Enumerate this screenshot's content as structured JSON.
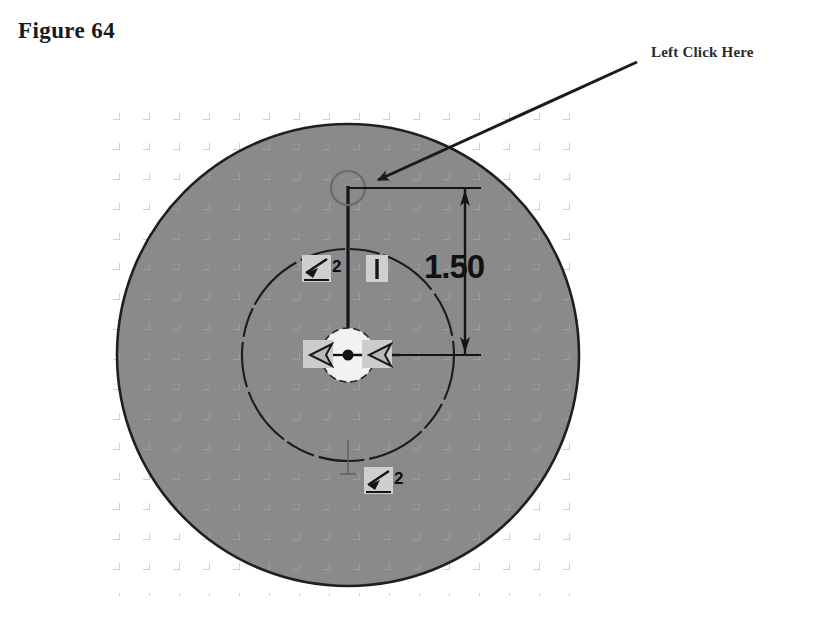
{
  "figure": {
    "label": "Figure 64"
  },
  "callout": {
    "label": "Left Click Here",
    "arrow_from": [
      637,
      62
    ],
    "arrow_to": [
      372,
      183
    ]
  },
  "sketch": {
    "title": "circle sketch with vertical dimension",
    "background_color": "#ffffff",
    "face_fill_color": "#8a8a8a",
    "edge_color": "#1f1f1f",
    "grid_color": "#c9c9c9",
    "grid_spacing_px": 30,
    "outer_circle": {
      "cx": 348,
      "cy": 355,
      "r": 231
    },
    "inner_circle": {
      "cx": 348,
      "cy": 355,
      "r": 106
    },
    "center_point": {
      "cx": 348,
      "cy": 355
    },
    "top_point": {
      "cx": 348,
      "cy": 188,
      "highlight_r": 17
    },
    "construction_line": {
      "x": 348,
      "y1": 188,
      "y2": 355
    }
  },
  "dimension": {
    "value_text": "1.50",
    "text_x": 424,
    "text_y": 248,
    "ext_line_top_y": 188,
    "ext_line_bottom_y": 355,
    "ext_line_x1": 348,
    "ext_line_x2": 481,
    "dim_line_x": 465,
    "arrow_top_y": 198,
    "arrow_bottom_y": 345
  },
  "constraints": [
    {
      "name": "tangent-constraint-upper-left",
      "symbol": "tangent",
      "count": "2",
      "x": 304,
      "y": 258
    },
    {
      "name": "vertical-constraint",
      "symbol": "vertical",
      "count": "",
      "x": 368,
      "y": 258
    },
    {
      "name": "tangent-constraint-left-center",
      "symbol": "tangent-arrow-left",
      "count": "",
      "x": 305,
      "y": 341
    },
    {
      "name": "tangent-constraint-right-center",
      "symbol": "tangent-arrow-right",
      "count": "",
      "x": 363,
      "y": 341
    },
    {
      "name": "tangent-constraint-bottom",
      "symbol": "tangent",
      "count": "2",
      "x": 366,
      "y": 470
    }
  ],
  "colors": {
    "face": "#8a8a8a",
    "grid": "#c9c9c9",
    "edge": "#1f1f1f",
    "badge": "#cfcfcf",
    "text": "#111111",
    "page": "#ffffff"
  }
}
